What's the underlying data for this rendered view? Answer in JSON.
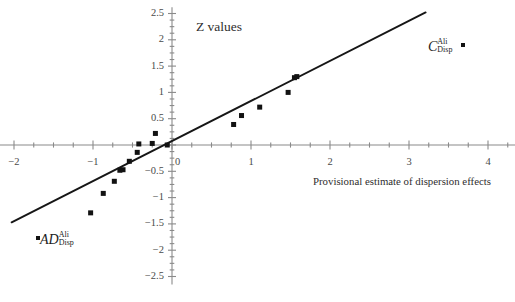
{
  "chart_data": {
    "type": "scatter",
    "title": "Z values",
    "xlabel": "Provisional estimate of dispersion effects",
    "ylabel": "Z values",
    "xlim": [
      -2.2,
      4.35
    ],
    "ylim": [
      -2.65,
      2.62
    ],
    "xticks": [
      -2,
      -1,
      0,
      1,
      2,
      3,
      4
    ],
    "xtick_labels": [
      "−2",
      "−1",
      "0",
      "1",
      "2",
      "3",
      "4"
    ],
    "xtick_minor_step": 0.25,
    "yticks": [
      -2.5,
      -2,
      -1.5,
      -1,
      -0.5,
      0,
      0.5,
      1,
      1.5,
      2,
      2.5
    ],
    "ytick_labels": [
      "−2.5",
      "−2",
      "−1.5",
      "−1",
      "−0.5",
      "0",
      "0.5",
      "1",
      "1.5",
      "2",
      "2.5"
    ],
    "ytick_minor_step": 0.125,
    "grid": false,
    "legend": "none",
    "marker": "filled-square",
    "marker_color": "#121212",
    "line_color": "#161616",
    "points": [
      {
        "x": -1.03,
        "y": -1.29
      },
      {
        "x": -0.87,
        "y": -0.92
      },
      {
        "x": -0.73,
        "y": -0.69
      },
      {
        "x": -0.66,
        "y": -0.48
      },
      {
        "x": -0.62,
        "y": -0.47
      },
      {
        "x": -0.54,
        "y": -0.31
      },
      {
        "x": -0.44,
        "y": -0.14
      },
      {
        "x": -0.42,
        "y": 0.02
      },
      {
        "x": -0.25,
        "y": 0.03
      },
      {
        "x": -0.21,
        "y": 0.22
      },
      {
        "x": -0.06,
        "y": 0.0
      },
      {
        "x": 0.78,
        "y": 0.39
      },
      {
        "x": 0.88,
        "y": 0.56
      },
      {
        "x": 1.11,
        "y": 0.72
      },
      {
        "x": 1.47,
        "y": 1.0
      },
      {
        "x": 1.55,
        "y": 1.28
      },
      {
        "x": 1.58,
        "y": 1.3
      }
    ],
    "fit_line": {
      "x0": -2.03,
      "y0": -1.47,
      "x1": 3.21,
      "y1": 2.52
    },
    "annotations": [
      {
        "name": "AD-Disp-Ali",
        "base": "AD",
        "sup": "Ali",
        "sub": "Disp",
        "marker_side": "left",
        "x_px": 36,
        "y_px": 236
      },
      {
        "name": "C-Disp-Ali",
        "base": "C",
        "sup": "Ali",
        "sub": "Disp",
        "marker_side": "right",
        "x_px": 430,
        "y_px": 40
      }
    ]
  },
  "labels": {
    "title": "Z values",
    "xaxis_title": "Provisional estimate of dispersion effects",
    "ad_base": "AD",
    "ad_sup": "Ali",
    "ad_sub": "Disp",
    "c_base": "C",
    "c_sup": "Ali",
    "c_sub": "Disp"
  }
}
